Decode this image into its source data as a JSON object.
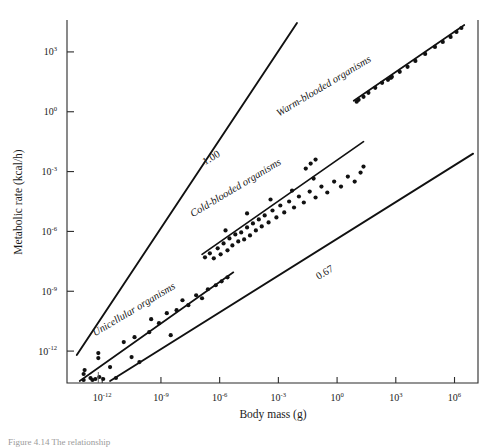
{
  "figure": {
    "caption_fragment": "Figure 4.14  The relationship"
  },
  "chart_data": {
    "type": "scatter",
    "title": "",
    "xlabel": "Body mass (g)",
    "ylabel": "Metabolic rate (kcal/h)",
    "xscale": "log10",
    "yscale": "log10",
    "xlim_exp": [
      -13.8,
      7.2
    ],
    "ylim_exp": [
      -13.6,
      4.6
    ],
    "grid": false,
    "legend": "none",
    "xticks_exp": [
      -12,
      -9,
      -6,
      -3,
      0,
      3,
      6
    ],
    "xtick_labels": [
      "10-12",
      "10-9",
      "10-6",
      "10-3",
      "100",
      "103",
      "106"
    ],
    "xtick_bases": [
      "10",
      "10",
      "10",
      "10",
      "10",
      "10",
      "10"
    ],
    "xtick_exps": [
      "-12",
      "-9",
      "-6",
      "-3",
      "0",
      "3",
      "6"
    ],
    "yticks_exp": [
      -12,
      -9,
      -6,
      -3,
      0,
      3
    ],
    "ytick_bases": [
      "10",
      "10",
      "10",
      "10",
      "10",
      "10"
    ],
    "ytick_exps": [
      "-12",
      "-9",
      "-6",
      "-3",
      "0",
      "3"
    ],
    "reference_lines": [
      {
        "name": "slope-1.00-reference",
        "label": "1.00",
        "slope": 1.0,
        "x_start_exp": -13.3,
        "y_start_exp": -12.2,
        "x_end_exp": -2.05,
        "y_end_exp": 4.45,
        "label_x_exp": -6.35,
        "label_y_exp": -2.45,
        "label_rotation": -31
      },
      {
        "name": "slope-0.67-reference",
        "label": "0.67",
        "slope": 0.67,
        "x_start_exp": -11.6,
        "y_start_exp": -13.5,
        "x_end_exp": 6.95,
        "y_end_exp": -2.1,
        "label_x_exp": -0.55,
        "label_y_exp": -8.2,
        "label_rotation": -31
      }
    ],
    "series": [
      {
        "name": "Unicellular organisms",
        "label": "Unicellular organisms",
        "label_x_exp": -10.3,
        "label_y_exp": -10.05,
        "label_rotation": -31,
        "fit_line": {
          "x_start_exp": -13.15,
          "y_start_exp": -13.5,
          "x_end_exp": -5.3,
          "y_end_exp": -8.05
        },
        "points": [
          [
            -12.95,
            -13.45
          ],
          [
            -12.95,
            -13.15
          ],
          [
            -12.9,
            -12.95
          ],
          [
            -12.6,
            -13.35
          ],
          [
            -12.5,
            -13.45
          ],
          [
            -12.35,
            -13.4
          ],
          [
            -12.2,
            -12.35
          ],
          [
            -12.2,
            -12.1
          ],
          [
            -12.15,
            -13.3
          ],
          [
            -11.95,
            -13.4
          ],
          [
            -11.6,
            -12.8
          ],
          [
            -11.3,
            -13.35
          ],
          [
            -10.9,
            -11.55
          ],
          [
            -10.5,
            -12.3
          ],
          [
            -10.35,
            -11.3
          ],
          [
            -10.1,
            -12.55
          ],
          [
            -9.6,
            -11.05
          ],
          [
            -9.5,
            -10.4
          ],
          [
            -9.1,
            -10.6
          ],
          [
            -8.7,
            -10.1
          ],
          [
            -8.5,
            -11.2
          ],
          [
            -8.2,
            -9.95
          ],
          [
            -7.9,
            -9.45
          ],
          [
            -7.6,
            -9.7
          ],
          [
            -7.2,
            -9.2
          ],
          [
            -6.9,
            -9.35
          ],
          [
            -6.6,
            -8.9
          ],
          [
            -6.2,
            -8.7
          ],
          [
            -5.9,
            -8.5
          ],
          [
            -5.6,
            -8.3
          ]
        ]
      },
      {
        "name": "Cold-blooded organisms",
        "label": "Cold-blooded organisms",
        "label_x_exp": -5.1,
        "label_y_exp": -3.95,
        "label_rotation": -31,
        "fit_line": {
          "x_start_exp": -6.9,
          "y_start_exp": -7.15,
          "x_end_exp": 1.35,
          "y_end_exp": -1.5
        },
        "points": [
          [
            -6.75,
            -7.3
          ],
          [
            -6.5,
            -7.1
          ],
          [
            -6.3,
            -7.35
          ],
          [
            -6.1,
            -6.85
          ],
          [
            -5.95,
            -7.15
          ],
          [
            -5.8,
            -6.6
          ],
          [
            -5.6,
            -6.95
          ],
          [
            -5.5,
            -6.35
          ],
          [
            -5.35,
            -6.7
          ],
          [
            -5.2,
            -6.15
          ],
          [
            -5.05,
            -6.5
          ],
          [
            -4.9,
            -6.05
          ],
          [
            -4.75,
            -6.4
          ],
          [
            -4.6,
            -5.8
          ],
          [
            -4.45,
            -6.2
          ],
          [
            -4.3,
            -5.6
          ],
          [
            -4.15,
            -5.95
          ],
          [
            -4.0,
            -5.4
          ],
          [
            -3.85,
            -5.75
          ],
          [
            -3.7,
            -5.2
          ],
          [
            -3.5,
            -5.55
          ],
          [
            -3.3,
            -4.95
          ],
          [
            -3.1,
            -5.3
          ],
          [
            -2.9,
            -4.7
          ],
          [
            -2.7,
            -5.05
          ],
          [
            -2.45,
            -4.5
          ],
          [
            -2.2,
            -4.8
          ],
          [
            -1.95,
            -4.25
          ],
          [
            -1.7,
            -4.55
          ],
          [
            -1.4,
            -4.0
          ],
          [
            -1.1,
            -4.3
          ],
          [
            -0.8,
            -3.75
          ],
          [
            -0.5,
            -4.05
          ],
          [
            -0.15,
            -3.5
          ],
          [
            0.2,
            -3.75
          ],
          [
            0.55,
            -3.25
          ],
          [
            0.9,
            -3.5
          ],
          [
            1.2,
            -3.05
          ],
          [
            1.35,
            -2.75
          ],
          [
            -5.7,
            -5.95
          ],
          [
            -4.6,
            -5.1
          ],
          [
            -3.4,
            -4.4
          ],
          [
            -2.3,
            -3.95
          ],
          [
            -1.2,
            -3.35
          ]
        ]
      },
      {
        "name": "Warm-blooded organisms",
        "label": "Warm-blooded organisms",
        "label_x_exp": -0.6,
        "label_y_exp": 1.15,
        "label_rotation": -31,
        "fit_line": {
          "x_start_exp": 0.85,
          "y_start_exp": 0.55,
          "x_end_exp": 6.5,
          "y_end_exp": 4.35
        },
        "points": [
          [
            1.0,
            0.5
          ],
          [
            1.1,
            0.6
          ],
          [
            1.35,
            0.75
          ],
          [
            1.6,
            0.95
          ],
          [
            1.95,
            1.2
          ],
          [
            2.3,
            1.45
          ],
          [
            2.6,
            1.6
          ],
          [
            2.75,
            1.7
          ],
          [
            2.8,
            1.75
          ],
          [
            3.2,
            2.0
          ],
          [
            3.6,
            2.25
          ],
          [
            4.0,
            2.55
          ],
          [
            4.5,
            2.9
          ],
          [
            5.0,
            3.25
          ],
          [
            5.4,
            3.5
          ],
          [
            5.8,
            3.75
          ],
          [
            6.1,
            4.0
          ],
          [
            6.35,
            4.2
          ]
        ]
      }
    ],
    "extra_points": [
      [
        -1.35,
        -2.6
      ],
      [
        -1.6,
        -2.85
      ],
      [
        -1.1,
        -2.4
      ]
    ]
  }
}
